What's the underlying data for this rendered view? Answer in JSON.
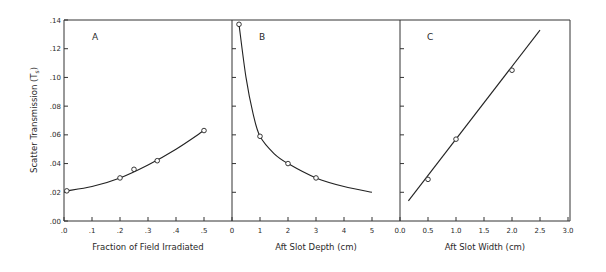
{
  "figure": {
    "ylabel": "Scatter Transmission (T",
    "ylabel_sub": "s",
    "ylabel_close": ")",
    "yticks": [
      ".00",
      ".02",
      ".04",
      ".06",
      ".08",
      ".10",
      ".12",
      ".14"
    ],
    "panels": [
      {
        "letter": "A",
        "xlabel": "Fraction of Field Irradiated",
        "xticks": [
          ".0",
          ".1",
          ".2",
          ".3",
          ".4",
          ".5"
        ]
      },
      {
        "letter": "B",
        "xlabel": "Aft Slot Depth (cm)",
        "xticks": [
          "0",
          "1",
          "2",
          "3",
          "4",
          "5"
        ]
      },
      {
        "letter": "C",
        "xlabel": "Aft Slot Width (cm)",
        "xticks": [
          "0.0",
          "0.5",
          "1.0",
          "1.5",
          "2.0",
          "2.5",
          "3.0"
        ]
      }
    ]
  },
  "chart_data": [
    {
      "type": "line",
      "title": "A",
      "xlabel": "Fraction of Field Irradiated",
      "ylabel": "Scatter Transmission (Ts)",
      "xlim": [
        0,
        0.6
      ],
      "ylim": [
        0,
        0.14
      ],
      "points": {
        "x": [
          0.01,
          0.2,
          0.25,
          0.333,
          0.5
        ],
        "y": [
          0.021,
          0.03,
          0.036,
          0.042,
          0.063
        ]
      },
      "curve": {
        "x": [
          0.01,
          0.1,
          0.2,
          0.3,
          0.4,
          0.5
        ],
        "y": [
          0.021,
          0.024,
          0.03,
          0.039,
          0.05,
          0.063
        ]
      }
    },
    {
      "type": "line",
      "title": "B",
      "xlabel": "Aft Slot Depth (cm)",
      "ylabel": "Scatter Transmission (Ts)",
      "xlim": [
        0,
        6
      ],
      "ylim": [
        0,
        0.14
      ],
      "points": {
        "x": [
          0.25,
          1,
          2,
          3
        ],
        "y": [
          0.137,
          0.059,
          0.04,
          0.03
        ]
      },
      "curve": {
        "x": [
          0.25,
          0.5,
          0.75,
          1,
          1.5,
          2,
          3,
          4,
          5
        ],
        "y": [
          0.137,
          0.1,
          0.075,
          0.059,
          0.047,
          0.04,
          0.03,
          0.024,
          0.02
        ]
      }
    },
    {
      "type": "line",
      "title": "C",
      "xlabel": "Aft Slot Width (cm)",
      "ylabel": "Scatter Transmission (Ts)",
      "xlim": [
        0,
        3.0
      ],
      "ylim": [
        0,
        0.14
      ],
      "points": {
        "x": [
          0.5,
          1.0,
          2.0
        ],
        "y": [
          0.029,
          0.057,
          0.105
        ]
      },
      "fit_line": {
        "x": [
          0.15,
          2.5
        ],
        "y": [
          0.014,
          0.133
        ]
      }
    }
  ]
}
